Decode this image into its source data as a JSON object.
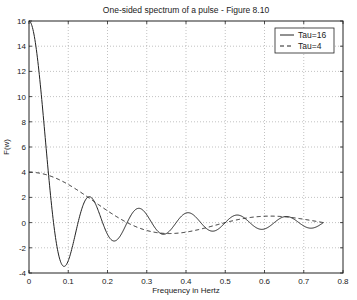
{
  "chart_data": {
    "type": "line",
    "title": "One-sided spectrum of a pulse - Figure 8.10",
    "xlabel": "Frequency in Hertz",
    "ylabel": "F(w)",
    "xlim": [
      0,
      0.8
    ],
    "ylim": [
      -4,
      16
    ],
    "xticks": [
      0,
      0.1,
      0.2,
      0.3,
      0.4,
      0.5,
      0.6,
      0.7,
      0.8
    ],
    "xtick_labels": [
      "0",
      "0.1",
      "0.2",
      "0.3",
      "0.4",
      "0.5",
      "0.6",
      "0.7",
      "0.8"
    ],
    "yticks": [
      -4,
      -2,
      0,
      2,
      4,
      6,
      8,
      10,
      12,
      14,
      16
    ],
    "ytick_labels": [
      "-4",
      "-2",
      "0",
      "2",
      "4",
      "6",
      "8",
      "10",
      "12",
      "14",
      "16"
    ],
    "grid": true,
    "legend_position": "upper right",
    "x": [
      0,
      0.0625,
      0.089,
      0.125,
      0.156,
      0.1875,
      0.219,
      0.25,
      0.281,
      0.3125,
      0.344,
      0.375,
      0.406,
      0.4375,
      0.469,
      0.5,
      0.531,
      0.5625,
      0.594,
      0.625,
      0.656,
      0.6875,
      0.719,
      0.75
    ],
    "series": [
      {
        "name": "Tau=16",
        "style": "solid",
        "formula": "16*sin(pi*16*f)/(pi*16*f)",
        "values": [
          16,
          0,
          -3.47,
          0,
          2.05,
          0,
          -1.45,
          0,
          1.13,
          0,
          -0.92,
          0,
          0.78,
          0,
          -0.68,
          0,
          0.6,
          0,
          -0.54,
          0,
          0.49,
          0,
          -0.44,
          0
        ]
      },
      {
        "name": "Tau=4",
        "style": "dashed",
        "formula": "4*sin(pi*4*f)/(pi*4*f)",
        "values": [
          4,
          3.6,
          3.22,
          2.55,
          1.84,
          1.2,
          0.6,
          0,
          -0.45,
          -0.72,
          -0.86,
          -0.85,
          -0.7,
          -0.5,
          -0.26,
          0,
          0.21,
          0.34,
          0.4,
          0.38,
          0.3,
          0.18,
          0.08,
          0
        ]
      }
    ]
  }
}
